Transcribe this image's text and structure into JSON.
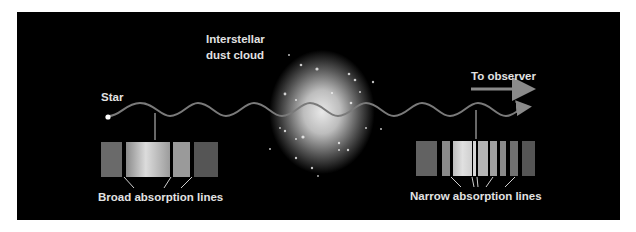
{
  "diagram": {
    "labels": {
      "cloud_line1": "Interstellar",
      "cloud_line2": "dust cloud",
      "star": "Star",
      "observer": "To observer",
      "broad": "Broad absorption lines",
      "narrow": "Narrow absorption lines"
    },
    "colors": {
      "background": "#000000",
      "frame": "#ffffff",
      "wave": "#7a7a7a",
      "text": "#e2e2e2",
      "arrow": "#8a8a8a"
    },
    "broad_spectrum": [
      {
        "x": 101,
        "w": 21,
        "color": "#6a6a6a"
      },
      {
        "x": 126,
        "w": 44,
        "color": "gradient-bright"
      },
      {
        "x": 173,
        "w": 17,
        "color": "#9a9a9a"
      },
      {
        "x": 194,
        "w": 24,
        "color": "#555555"
      }
    ],
    "narrow_spectrum": [
      {
        "x": 416,
        "w": 21,
        "color": "#626262"
      },
      {
        "x": 442,
        "w": 8,
        "color": "#8a8a8a"
      },
      {
        "x": 453,
        "w": 19,
        "color": "gradient-bright"
      },
      {
        "x": 473,
        "w": 3,
        "color": "#d5d5d5"
      },
      {
        "x": 478,
        "w": 10,
        "color": "#b5b5b5"
      },
      {
        "x": 490,
        "w": 7,
        "color": "#a0a0a0"
      },
      {
        "x": 500,
        "w": 6,
        "color": "#8a8a8a"
      },
      {
        "x": 510,
        "w": 8,
        "color": "#707070"
      },
      {
        "x": 522,
        "w": 13,
        "color": "#555555"
      }
    ]
  }
}
